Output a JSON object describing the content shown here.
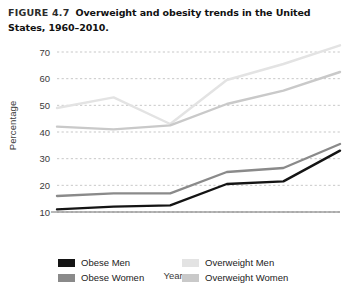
{
  "figure": {
    "label": "FIGURE 4.7",
    "caption": "Overweight and obesity trends in the United States, 1960–2010."
  },
  "axes": {
    "ylabel": "Percentage",
    "xlabel": "Years",
    "ytick_labels": [
      "70",
      "60",
      "50",
      "40",
      "30",
      "20",
      "10"
    ],
    "xtick_labels": [
      "1960",
      "1970",
      "1980",
      "1990",
      "2000",
      "2010"
    ]
  },
  "legend": {
    "items": [
      {
        "label": "Obese Men",
        "color": "#141414"
      },
      {
        "label": "Overweight Men",
        "color": "#e3e3e3"
      },
      {
        "label": "Obese Women",
        "color": "#8a8a8a"
      },
      {
        "label": "Overweight Women",
        "color": "#c9c9c9"
      }
    ]
  },
  "chart_data": {
    "type": "line",
    "title": "Overweight and obesity trends in the United States, 1960–2010.",
    "xlabel": "Years",
    "ylabel": "Percentage",
    "x": [
      1960,
      1970,
      1980,
      1990,
      2000,
      2010
    ],
    "xlim": [
      1960,
      2010
    ],
    "ylim": [
      10,
      70
    ],
    "ytick_values": [
      10,
      20,
      30,
      40,
      50,
      60,
      70
    ],
    "grid": true,
    "legend_position": "bottom",
    "series": [
      {
        "name": "Obese Men",
        "color": "#141414",
        "values": [
          11.0,
          12.0,
          12.5,
          20.5,
          21.5,
          33.0
        ]
      },
      {
        "name": "Obese Women",
        "color": "#8a8a8a",
        "values": [
          16.0,
          17.0,
          17.0,
          25.0,
          26.5,
          35.5
        ]
      },
      {
        "name": "Overweight Men",
        "color": "#e3e3e3",
        "values": [
          49.0,
          53.0,
          43.0,
          59.5,
          65.5,
          72.5
        ]
      },
      {
        "name": "Overweight Women",
        "color": "#c9c9c9",
        "values": [
          42.0,
          41.0,
          42.5,
          50.5,
          55.5,
          62.5
        ]
      }
    ]
  }
}
